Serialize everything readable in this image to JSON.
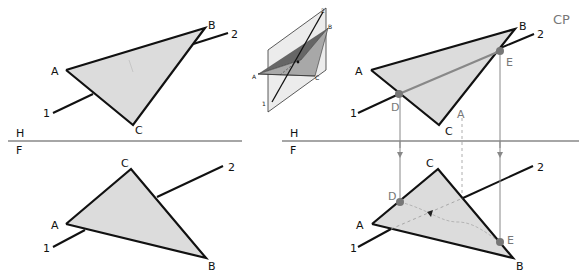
{
  "figure": {
    "type": "descriptive-geometry"
  },
  "fold_line": {
    "upper_label": "H",
    "lower_label": "F"
  },
  "left_views": {
    "top": {
      "vertices": [
        "A",
        "B",
        "C"
      ],
      "line_ends": [
        "1",
        "2"
      ]
    },
    "front": {
      "vertices": [
        "A",
        "B",
        "C"
      ],
      "line_ends": [
        "1",
        "2"
      ]
    }
  },
  "pictorial": {
    "labels": {
      "a": "A",
      "b": "B",
      "c": "C",
      "one": "1",
      "two": "2"
    }
  },
  "right_views": {
    "top": {
      "vertices": [
        "A",
        "B",
        "C"
      ],
      "line_ends": [
        "1",
        "2"
      ],
      "points": [
        "D",
        "E"
      ],
      "annotation": "CP",
      "arrow_mark": "A"
    },
    "front": {
      "vertices": [
        "A",
        "B",
        "C"
      ],
      "line_ends": [
        "1",
        "2"
      ],
      "points": [
        "D",
        "E"
      ]
    }
  },
  "colors": {
    "triangle_fill": "#dcdcdc",
    "edge": "#111111",
    "construction": "#888888",
    "point": "#777777"
  }
}
